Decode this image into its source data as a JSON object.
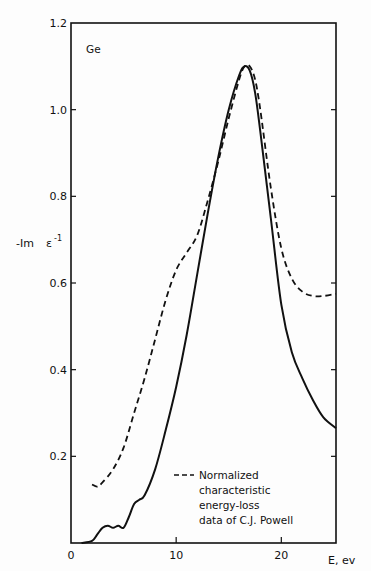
{
  "chart_data": {
    "type": "line",
    "title": "",
    "annotation": "Ge",
    "xlabel": "E, ev",
    "ylabel_main": "-Im",
    "ylabel_symbol": "ε",
    "ylabel_exponent": "-1",
    "xlim": [
      0,
      25.2
    ],
    "ylim": [
      0,
      1.2
    ],
    "grid": false,
    "x_ticks": [
      0,
      10,
      20
    ],
    "x_tick_labels": [
      "0",
      "10",
      "20"
    ],
    "y_ticks": [
      0.2,
      0.4,
      0.6,
      0.8,
      1.0,
      1.2
    ],
    "y_tick_labels": [
      "0.2",
      "0.4",
      "0.6",
      "0.8",
      "1.0",
      "1.2"
    ],
    "legend": {
      "placement": "bottom-center",
      "entries": [
        {
          "series": "experimental",
          "style": "dashed",
          "lines": [
            "Normalized",
            "characteristic",
            "energy-loss",
            "data of  C.J. Powell"
          ]
        }
      ]
    },
    "series": [
      {
        "name": "calculated",
        "style": "solid",
        "color": "#111111",
        "x": [
          1,
          2,
          2.5,
          3,
          3.5,
          4,
          4.5,
          5,
          5.5,
          6,
          6.5,
          7,
          8,
          9,
          10,
          11,
          12,
          13,
          14,
          15,
          16,
          16.5,
          17,
          17.5,
          18,
          19,
          20,
          21,
          22,
          23,
          24,
          25.2
        ],
        "y": [
          0,
          0.005,
          0.02,
          0.035,
          0.04,
          0.035,
          0.04,
          0.035,
          0.06,
          0.09,
          0.1,
          0.11,
          0.17,
          0.26,
          0.36,
          0.48,
          0.62,
          0.76,
          0.89,
          1.0,
          1.08,
          1.1,
          1.09,
          1.04,
          0.95,
          0.75,
          0.55,
          0.44,
          0.38,
          0.33,
          0.29,
          0.265
        ]
      },
      {
        "name": "experimental",
        "style": "dashed",
        "color": "#111111",
        "x": [
          2,
          2.5,
          3,
          4,
          5,
          6,
          7,
          8,
          9,
          10,
          11,
          12,
          13,
          14,
          15,
          16,
          16.5,
          17,
          17.5,
          18,
          19,
          20,
          21,
          22,
          23,
          24,
          25.2
        ],
        "y": [
          0.135,
          0.13,
          0.14,
          0.17,
          0.22,
          0.3,
          0.38,
          0.47,
          0.56,
          0.63,
          0.67,
          0.71,
          0.79,
          0.88,
          0.98,
          1.07,
          1.1,
          1.1,
          1.07,
          1.0,
          0.82,
          0.68,
          0.61,
          0.58,
          0.57,
          0.57,
          0.575
        ]
      }
    ]
  }
}
